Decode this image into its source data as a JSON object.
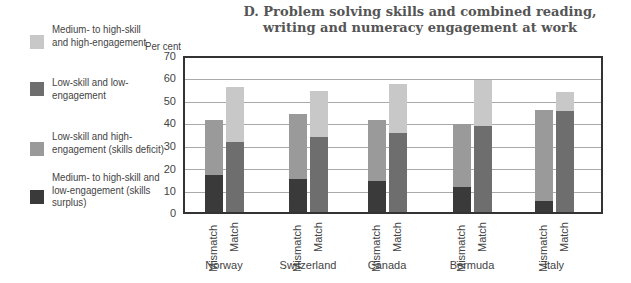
{
  "chart_data": {
    "type": "bar",
    "stacked": true,
    "title": "D.  Problem solving skills and combined reading, writing and numeracy engagement at work",
    "ylabel": "Per cent",
    "xlabel": "",
    "ylim": [
      0,
      70
    ],
    "yticks": [
      0,
      10,
      20,
      30,
      40,
      50,
      60,
      70
    ],
    "grid": true,
    "legend_position": "left",
    "groups": [
      "Norway",
      "Switzerland",
      "Canada",
      "Bermuda",
      "Italy"
    ],
    "bar_labels": [
      "Mismatch",
      "Match"
    ],
    "categories": [
      "Norway Mismatch",
      "Norway Match",
      "Switzerland Mismatch",
      "Switzerland Match",
      "Canada Mismatch",
      "Canada Match",
      "Bermuda Mismatch",
      "Bermuda Match",
      "Italy Mismatch",
      "Italy Match"
    ],
    "series": [
      {
        "name": "Medium- to high-skill and low-engagement (skills surplus)",
        "color": "#3a3a3a",
        "values": [
          17,
          null,
          15,
          null,
          14,
          null,
          11.5,
          null,
          5,
          null
        ]
      },
      {
        "name": "Low-skill and high-engagement (skills deficit)",
        "color": "#9a9a9a",
        "values": [
          25,
          null,
          29.5,
          null,
          28,
          null,
          28.5,
          null,
          41.5,
          null
        ]
      },
      {
        "name": "Low-skill and low-engagement",
        "color": "#6e6e6e",
        "values": [
          null,
          32,
          null,
          34,
          null,
          36,
          null,
          39,
          null,
          46
        ]
      },
      {
        "name": "Medium- to high-skill and high-engagement",
        "color": "#c8c8c8",
        "values": [
          null,
          25,
          null,
          21,
          null,
          22,
          null,
          21,
          null,
          8.5
        ]
      }
    ],
    "totals": [
      42,
      57,
      44.5,
      55,
      42,
      58,
      40,
      60,
      46.5,
      54.5
    ]
  },
  "title_line1": "D.  Problem solving skills and combined reading,",
  "title_line2": "writing and numeracy engagement at work",
  "legend": [
    {
      "label": "Medium- to high-skill and high-engagement",
      "color": "#c8c8c8"
    },
    {
      "label": "Low-skill and low-engagement",
      "color": "#6e6e6e"
    },
    {
      "label": "Low-skill and high-engagement (skills deficit)",
      "color": "#9a9a9a"
    },
    {
      "label": "Medium- to high-skill and low-engagement (skills surplus)",
      "color": "#3a3a3a"
    }
  ],
  "ylabel": "Per cent",
  "yticks": [
    "70",
    "60",
    "50",
    "40",
    "30",
    "20",
    "10",
    "0"
  ],
  "xlabels": {
    "mismatch": "Mismatch",
    "match": "Match"
  },
  "countries": [
    "Norway",
    "Switzerland",
    "Canada",
    "Bermuda",
    "Italy"
  ]
}
